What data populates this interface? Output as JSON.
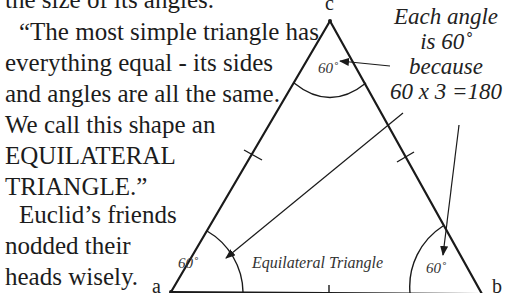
{
  "text": {
    "top_fragment": "the size of its angles.",
    "quote_lines": [
      "“The most simple triangle has",
      "everything equal - its sides",
      "and angles are all the same.",
      "We call this shape an",
      "EQUILATERAL",
      "TRIANGLE.”"
    ],
    "euclid_lines": [
      "Euclid’s friends",
      "nodded their",
      "heads wisely."
    ]
  },
  "diagram": {
    "title": "Equilateral Triangle",
    "vertices": {
      "top": "c",
      "bottom_left": "a",
      "bottom_right": "b"
    },
    "angles": {
      "top": "60˚",
      "bottom_left": "60˚",
      "bottom_right": "60˚"
    },
    "annotation_lines": [
      "Each angle",
      "is 60˚",
      "because",
      "60 x 3 =180"
    ],
    "colors": {
      "stroke": "#1a1a1a",
      "background": "#ffffff"
    }
  }
}
